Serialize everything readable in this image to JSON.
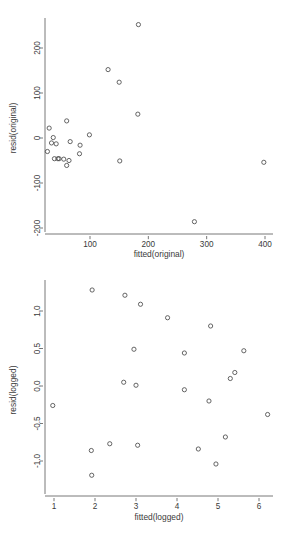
{
  "figure": {
    "title": "",
    "panels": 2,
    "background": "#ffffff",
    "marker_color": "#4a4a4a",
    "axis_color": "#565656"
  },
  "chart_data": [
    {
      "type": "scatter",
      "title": "",
      "xlabel": "fitted(original)",
      "ylabel": "resid(original)",
      "xlim": [
        15,
        410
      ],
      "ylim": [
        -215,
        275
      ],
      "xticks": [
        100,
        200,
        300,
        400
      ],
      "yticks": [
        200,
        100,
        0,
        -100,
        -200
      ],
      "xticklabels": [
        "100",
        "200",
        "300",
        "400"
      ],
      "yticklabels": [
        "200",
        "100",
        "0",
        "-100",
        "-200"
      ],
      "grid": false,
      "legend": "none",
      "marker": "open-circle",
      "points": [
        {
          "x": 183,
          "y": 252
        },
        {
          "x": 131,
          "y": 152
        },
        {
          "x": 150,
          "y": 124
        },
        {
          "x": 182,
          "y": 53
        },
        {
          "x": 60,
          "y": 38
        },
        {
          "x": 30,
          "y": 22
        },
        {
          "x": 99,
          "y": 7
        },
        {
          "x": 37,
          "y": 1
        },
        {
          "x": 34,
          "y": -11
        },
        {
          "x": 42,
          "y": -13
        },
        {
          "x": 66,
          "y": -8
        },
        {
          "x": 83,
          "y": -16
        },
        {
          "x": 27,
          "y": -30
        },
        {
          "x": 82,
          "y": -35
        },
        {
          "x": 39,
          "y": -46
        },
        {
          "x": 45,
          "y": -46
        },
        {
          "x": 47,
          "y": -46
        },
        {
          "x": 55,
          "y": -47
        },
        {
          "x": 64,
          "y": -50
        },
        {
          "x": 151,
          "y": -51
        },
        {
          "x": 398,
          "y": -54
        },
        {
          "x": 60,
          "y": -61
        },
        {
          "x": 279,
          "y": -186
        }
      ]
    },
    {
      "type": "scatter",
      "title": "",
      "xlabel": "fitted(logged)",
      "ylabel": "resid(logged)",
      "xlim": [
        0.72,
        6.45
      ],
      "ylim": [
        -1.33,
        1.42
      ],
      "xticks": [
        1,
        2,
        3,
        4,
        5,
        6
      ],
      "yticks": [
        1.0,
        0.5,
        0.0,
        -0.5,
        -1.0
      ],
      "xticklabels": [
        "1",
        "2",
        "3",
        "4",
        "5",
        "6"
      ],
      "yticklabels": [
        "1.0",
        "0.5",
        "0.0",
        "-0.5",
        "-1.0"
      ],
      "grid": false,
      "legend": "none",
      "marker": "open-circle",
      "points": [
        {
          "x": 1.93,
          "y": 1.28
        },
        {
          "x": 2.73,
          "y": 1.21
        },
        {
          "x": 3.11,
          "y": 1.09
        },
        {
          "x": 3.77,
          "y": 0.91
        },
        {
          "x": 4.82,
          "y": 0.8
        },
        {
          "x": 2.95,
          "y": 0.49
        },
        {
          "x": 5.63,
          "y": 0.47
        },
        {
          "x": 4.18,
          "y": 0.44
        },
        {
          "x": 5.41,
          "y": 0.18
        },
        {
          "x": 5.3,
          "y": 0.1
        },
        {
          "x": 2.7,
          "y": 0.05
        },
        {
          "x": 3.0,
          "y": 0.01
        },
        {
          "x": 4.18,
          "y": -0.05
        },
        {
          "x": 4.78,
          "y": -0.2
        },
        {
          "x": 0.97,
          "y": -0.26
        },
        {
          "x": 6.21,
          "y": -0.38
        },
        {
          "x": 5.18,
          "y": -0.68
        },
        {
          "x": 2.36,
          "y": -0.77
        },
        {
          "x": 3.04,
          "y": -0.79
        },
        {
          "x": 4.52,
          "y": -0.84
        },
        {
          "x": 1.91,
          "y": -0.86
        },
        {
          "x": 4.95,
          "y": -1.04
        },
        {
          "x": 1.92,
          "y": -1.19
        }
      ]
    }
  ]
}
